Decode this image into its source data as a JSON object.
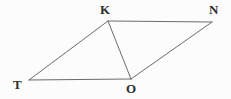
{
  "figure": {
    "type": "geometry-diagram",
    "background_color": "#fcfcfc",
    "stroke_color": "#6b6b6b",
    "stroke_width": 1,
    "label_color": "#2e2e2e",
    "vertices": [
      {
        "id": "K",
        "label": "K",
        "x": 108,
        "y": 21,
        "label_x": 100,
        "label_y": 3
      },
      {
        "id": "N",
        "label": "N",
        "x": 212,
        "y": 22,
        "label_x": 209,
        "label_y": 3
      },
      {
        "id": "T",
        "label": "T",
        "x": 29,
        "y": 80,
        "label_x": 13,
        "label_y": 78
      },
      {
        "id": "O",
        "label": "O",
        "x": 131,
        "y": 79,
        "label_x": 126,
        "label_y": 82
      }
    ],
    "edges": [
      {
        "name": "segment-TK",
        "from": "T",
        "to": "K",
        "x1": 29,
        "y1": 80,
        "x2": 108,
        "y2": 21
      },
      {
        "name": "segment-KN",
        "from": "K",
        "to": "N",
        "x1": 108,
        "y1": 21,
        "x2": 212,
        "y2": 22
      },
      {
        "name": "segment-NO",
        "from": "N",
        "to": "O",
        "x1": 212,
        "y1": 22,
        "x2": 131,
        "y2": 79
      },
      {
        "name": "segment-OT",
        "from": "O",
        "to": "T",
        "x1": 131,
        "y1": 79,
        "x2": 29,
        "y2": 80
      },
      {
        "name": "segment-KO",
        "from": "K",
        "to": "O",
        "x1": 108,
        "y1": 21,
        "x2": 131,
        "y2": 79
      }
    ]
  }
}
